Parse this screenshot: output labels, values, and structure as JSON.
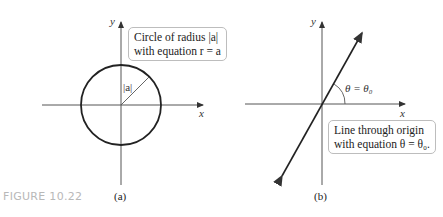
{
  "figure": {
    "label": "FIGURE 10.22"
  },
  "panel_a": {
    "caption": "(a)",
    "x_axis_label": "x",
    "y_axis_label": "y",
    "radius_label": "|a|",
    "callout_line1": "Circle of radius |a|",
    "callout_line2": "with equation r = a"
  },
  "panel_b": {
    "caption": "(b)",
    "x_axis_label": "x",
    "y_axis_label": "y",
    "angle_label": "θ = θ₀",
    "callout_line1": "Line through origin",
    "callout_line2": "with equation θ = θ₀."
  },
  "colors": {
    "stroke": "#222222",
    "axis": "#555555",
    "figure_label": "#b8b8b8",
    "callout_border": "#bdbdbd"
  }
}
